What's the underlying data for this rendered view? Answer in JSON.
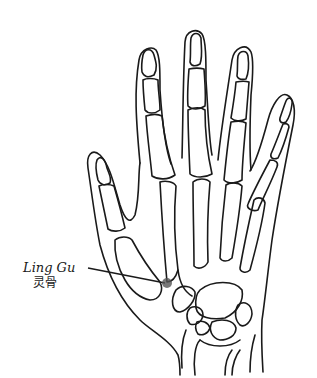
{
  "diagram": {
    "point": {
      "name_en": "Ling Gu",
      "name_zh": "灵骨",
      "marker_color": "#555555",
      "marker_x": 167,
      "marker_y": 283
    },
    "line_color": "#1a1a1a",
    "background": "#ffffff"
  }
}
